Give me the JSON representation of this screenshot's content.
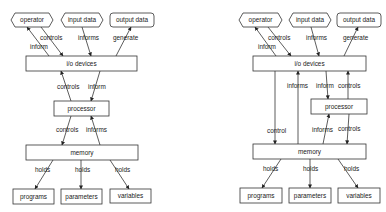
{
  "diagrams": [
    {
      "id": "left",
      "nodes": {
        "operator": {
          "label": "operator",
          "shape": "hexagon",
          "x": 11,
          "y": 13,
          "w": 42,
          "h": 14
        },
        "input_data": {
          "label": "input data",
          "shape": "hexagon",
          "x": 61,
          "y": 13,
          "w": 42,
          "h": 14
        },
        "output_data": {
          "label": "output data",
          "shape": "rounded",
          "x": 110,
          "y": 13,
          "w": 44,
          "h": 14
        },
        "io_devices": {
          "label": "i/o devices",
          "shape": "rect",
          "x": 26,
          "y": 56,
          "w": 111,
          "h": 15
        },
        "processor": {
          "label": "processor",
          "shape": "rect",
          "x": 54,
          "y": 101,
          "w": 55,
          "h": 15
        },
        "memory": {
          "label": "memory",
          "shape": "rect",
          "x": 26,
          "y": 145,
          "w": 112,
          "h": 15
        },
        "programs": {
          "label": "programs",
          "shape": "rect",
          "x": 13,
          "y": 189,
          "w": 41,
          "h": 15
        },
        "parameters": {
          "label": "parameters",
          "shape": "rect",
          "x": 61,
          "y": 189,
          "w": 41,
          "h": 15
        },
        "variables": {
          "label": "variables",
          "shape": "rect",
          "x": 110,
          "y": 189,
          "w": 41,
          "h": 14
        }
      },
      "edges": [
        {
          "label": "inform",
          "from": [
            49,
            56
          ],
          "to": [
            27,
            27
          ],
          "lx": 30,
          "ly": 49
        },
        {
          "label": "controls",
          "from": [
            41,
            27
          ],
          "to": [
            63,
            56
          ],
          "lx": 40,
          "ly": 40
        },
        {
          "label": "informs",
          "from": [
            82,
            27
          ],
          "to": [
            91,
            56
          ],
          "lx": 78,
          "ly": 40
        },
        {
          "label": "generate",
          "from": [
            116,
            56
          ],
          "to": [
            131,
            27
          ],
          "lx": 113,
          "ly": 40
        },
        {
          "label": "controls",
          "from": [
            71,
            101
          ],
          "to": [
            61,
            71
          ],
          "lx": 57,
          "ly": 89
        },
        {
          "label": "inform",
          "from": [
            100,
            71
          ],
          "to": [
            91,
            101
          ],
          "lx": 88,
          "ly": 89
        },
        {
          "label": "controls",
          "from": [
            71,
            116
          ],
          "to": [
            62,
            145
          ],
          "lx": 56,
          "ly": 132
        },
        {
          "label": "informs",
          "from": [
            100,
            145
          ],
          "to": [
            91,
            116
          ],
          "lx": 86,
          "ly": 132
        },
        {
          "label": "holds",
          "from": [
            53,
            160
          ],
          "to": [
            35,
            189
          ],
          "lx": 35,
          "ly": 172
        },
        {
          "label": "holds",
          "from": [
            81,
            160
          ],
          "to": [
            81,
            189
          ],
          "lx": 75,
          "ly": 172
        },
        {
          "label": "holds",
          "from": [
            110,
            160
          ],
          "to": [
            129,
            189
          ],
          "lx": 115,
          "ly": 172
        }
      ]
    },
    {
      "id": "right",
      "nodes": {
        "operator": {
          "label": "operator",
          "shape": "hexagon",
          "x": 239,
          "y": 13,
          "w": 43,
          "h": 14
        },
        "input_data": {
          "label": "input data",
          "shape": "hexagon",
          "x": 289,
          "y": 13,
          "w": 42,
          "h": 14
        },
        "output_data": {
          "label": "output data",
          "shape": "rounded",
          "x": 337,
          "y": 13,
          "w": 44,
          "h": 14
        },
        "io_devices": {
          "label": "i/o devices",
          "shape": "rect",
          "x": 253,
          "y": 56,
          "w": 113,
          "h": 15
        },
        "processor": {
          "label": "processor",
          "shape": "rect",
          "x": 311,
          "y": 99,
          "w": 56,
          "h": 15
        },
        "memory": {
          "label": "memory",
          "shape": "rect",
          "x": 253,
          "y": 144,
          "w": 113,
          "h": 15
        },
        "programs": {
          "label": "programs",
          "shape": "rect",
          "x": 240,
          "y": 188,
          "w": 42,
          "h": 15
        },
        "parameters": {
          "label": "parameters",
          "shape": "rect",
          "x": 289,
          "y": 188,
          "w": 42,
          "h": 15
        },
        "variables": {
          "label": "variables",
          "shape": "rect",
          "x": 338,
          "y": 188,
          "w": 42,
          "h": 15
        }
      },
      "edges": [
        {
          "label": "inform",
          "from": [
            276,
            56
          ],
          "to": [
            255,
            27
          ],
          "lx": 258,
          "ly": 49
        },
        {
          "label": "controls",
          "from": [
            268,
            27
          ],
          "to": [
            291,
            56
          ],
          "lx": 268,
          "ly": 40
        },
        {
          "label": "informs",
          "from": [
            311,
            27
          ],
          "to": [
            319,
            56
          ],
          "lx": 306,
          "ly": 40
        },
        {
          "label": "generate",
          "from": [
            344,
            56
          ],
          "to": [
            358,
            27
          ],
          "lx": 343,
          "ly": 40
        },
        {
          "label": "control",
          "from": [
            275,
            71
          ],
          "to": [
            275,
            144
          ],
          "lx": 267,
          "ly": 133
        },
        {
          "label": "informs",
          "from": [
            298,
            144
          ],
          "to": [
            298,
            71
          ],
          "lx": 287,
          "ly": 88
        },
        {
          "label": "inform",
          "from": [
            326,
            71
          ],
          "to": [
            328,
            99
          ],
          "lx": 316,
          "ly": 88
        },
        {
          "label": "controls",
          "from": [
            348,
            99
          ],
          "to": [
            348,
            71
          ],
          "lx": 338,
          "ly": 88
        },
        {
          "label": "informs",
          "from": [
            323,
            144
          ],
          "to": [
            329,
            114
          ],
          "lx": 312,
          "ly": 132
        },
        {
          "label": "controls",
          "from": [
            349,
            114
          ],
          "to": [
            347,
            144
          ],
          "lx": 338,
          "ly": 131
        },
        {
          "label": "holds",
          "from": [
            281,
            159
          ],
          "to": [
            262,
            188
          ],
          "lx": 263,
          "ly": 171
        },
        {
          "label": "holds",
          "from": [
            310,
            159
          ],
          "to": [
            310,
            188
          ],
          "lx": 303,
          "ly": 171
        },
        {
          "label": "holds",
          "from": [
            338,
            159
          ],
          "to": [
            358,
            188
          ],
          "lx": 344,
          "ly": 171
        }
      ]
    }
  ]
}
